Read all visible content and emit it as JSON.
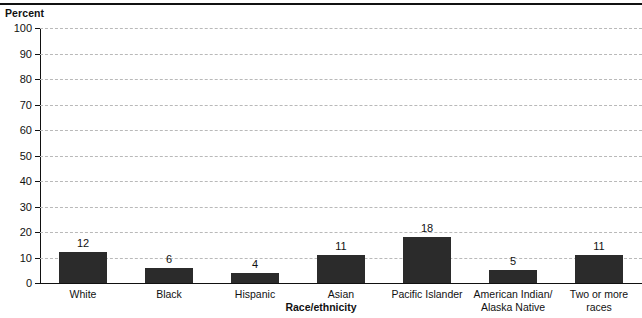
{
  "figure": {
    "top_cutoff_text": "",
    "y_axis_title": "Percent",
    "x_axis_title": "Race/ethnicity"
  },
  "chart_data": {
    "type": "bar",
    "title": "",
    "subtitle": "",
    "xlabel": "Race/ethnicity",
    "ylabel": "Percent",
    "categories": [
      "White",
      "Black",
      "Hispanic",
      "Asian",
      "Pacific Islander",
      "American Indian/ Alaska Native",
      "Two or more races"
    ],
    "category_lines": [
      [
        "White"
      ],
      [
        "Black"
      ],
      [
        "Hispanic"
      ],
      [
        "Asian"
      ],
      [
        "Pacific Islander"
      ],
      [
        "American Indian/",
        "Alaska Native"
      ],
      [
        "Two or more races"
      ]
    ],
    "values": [
      12,
      6,
      4,
      11,
      18,
      5,
      11
    ],
    "value_labels": [
      "12",
      "6",
      "4",
      "11",
      "18",
      "5",
      "11"
    ],
    "ylim": [
      0,
      100
    ],
    "ytick_values": [
      0,
      10,
      20,
      30,
      40,
      50,
      60,
      70,
      80,
      90,
      100
    ],
    "ytick_labels": [
      "0",
      "10",
      "20",
      "30",
      "40",
      "50",
      "60",
      "70",
      "80",
      "90",
      "100"
    ],
    "grid": true,
    "grid_style": "dashed",
    "legend": null,
    "bar_color": "#2b2b2b",
    "grid_color": "#b9b9b9",
    "axis_color": "#111111",
    "background": "#ffffff"
  }
}
